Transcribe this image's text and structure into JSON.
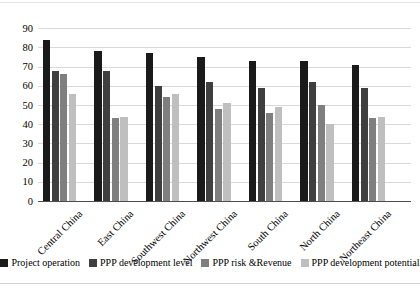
{
  "chart_data": {
    "type": "bar",
    "title": "",
    "xlabel": "",
    "ylabel": "",
    "categories": [
      "Central China",
      "East China",
      "Southwest China",
      "Northwest China",
      "South China",
      "North China",
      "Northeast China"
    ],
    "series": [
      {
        "name": "Project operation",
        "color": "#1a1a1a",
        "values": [
          84,
          78,
          77,
          75,
          73,
          73,
          71
        ]
      },
      {
        "name": "PPP development level",
        "color": "#3f3f3f",
        "values": [
          68,
          68,
          60,
          62,
          59,
          62,
          59
        ]
      },
      {
        "name": "PPP risk &Revenue",
        "color": "#7f7f7f",
        "values": [
          66,
          43,
          54,
          48,
          46,
          50,
          43
        ]
      },
      {
        "name": "PPP development potential",
        "color": "#bfbfbf",
        "values": [
          56,
          44,
          56,
          51,
          49,
          40,
          44
        ]
      }
    ],
    "ylim": [
      0,
      90
    ],
    "ytick_step": 10,
    "yticks": [
      0,
      10,
      20,
      30,
      40,
      50,
      60,
      70,
      80,
      90
    ],
    "grid": true,
    "legend_position": "bottom",
    "plot_bgcolor": "#ffffff",
    "gridline_color": "#d9d9d9",
    "axis_color": "#4d4d4d"
  }
}
